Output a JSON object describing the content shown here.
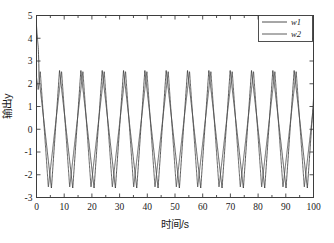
{
  "chart_data": {
    "type": "line",
    "title": "",
    "xlabel": "时间/s",
    "ylabel": "输出y",
    "xlim": [
      0,
      100
    ],
    "ylim": [
      -3,
      5
    ],
    "xticks": [
      0,
      10,
      20,
      30,
      40,
      50,
      60,
      70,
      80,
      90,
      100
    ],
    "xtick_labels": [
      "0",
      "10",
      "20",
      "30",
      "40",
      "50",
      "60",
      "70",
      "80",
      "90",
      "100"
    ],
    "yticks": [
      -3,
      -2,
      -1,
      0,
      1,
      2,
      3,
      4,
      5
    ],
    "ytick_labels": [
      "-3",
      "-2",
      "-1",
      "0",
      "1",
      "2",
      "3",
      "4",
      "5"
    ],
    "grid": false,
    "legend_position": "upper-right",
    "minor_xticks_per_major": 2,
    "series": [
      {
        "name": "w1",
        "color": "#3a3a3a",
        "linestyle": "solid",
        "amplitude": 2.6,
        "period": 7.7,
        "phase_deg": 0,
        "waveform": "triangular",
        "initial_spike_peak": 4.55,
        "initial_spike_duration": 0.9,
        "steady_min": -2.62,
        "steady_max": 2.62,
        "description": "Sharp-peaked triangular oscillation, fast rise / slow fall, about 13 cycles over 0-100 s"
      },
      {
        "name": "w2",
        "color": "#4a4a4a",
        "linestyle": "solid",
        "amplitude": 2.55,
        "period": 7.7,
        "phase_deg": 52,
        "waveform": "triangular",
        "initial_spike_peak": 2.3,
        "initial_spike_duration": 0.6,
        "steady_min": -2.58,
        "steady_max": 2.58,
        "description": "Triangular oscillation of the same period, phase lagged relative to w1, slow rise / fast fall"
      }
    ],
    "annotations": [
      {
        "text": "initial transient overshoot near t = 0 reaching about 4.5",
        "x": 0.3,
        "y": 4.55
      }
    ],
    "cycles_visible": 13
  },
  "legend": {
    "entries": [
      {
        "label": "w1"
      },
      {
        "label": "w2"
      }
    ]
  }
}
